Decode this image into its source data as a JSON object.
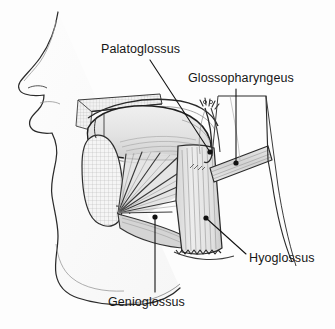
{
  "figure": {
    "background_color": "#fdfdfd",
    "ink_color": "#1a1a1a",
    "label_color": "#161616",
    "width": 335,
    "height": 329
  },
  "labels": [
    {
      "id": "palatoglossus",
      "text": "Palatoglossus",
      "leader": {
        "from_x": 150,
        "from_y": 60,
        "to_x": 210,
        "to_y": 152,
        "dot_x": 210,
        "dot_y": 152
      }
    },
    {
      "id": "glossopharyngeus",
      "text": "Glossopharyngeus",
      "leader": {
        "from_x": 236,
        "from_y": 89,
        "to_x": 236,
        "to_y": 163,
        "dot_x": 236,
        "dot_y": 163
      }
    },
    {
      "id": "hyoglossus",
      "text": "Hyoglossus",
      "leader": {
        "from_x": 246,
        "from_y": 254,
        "to_x": 206,
        "to_y": 218,
        "dot_x": 206,
        "dot_y": 218
      }
    },
    {
      "id": "genioglossus",
      "text": "Genioglossus",
      "leader": {
        "from_x": 155,
        "from_y": 292,
        "to_x": 155,
        "to_y": 217,
        "dot_x": 155,
        "dot_y": 217
      }
    }
  ],
  "anatomy": {
    "structures": [
      "facial profile",
      "nose",
      "upper lip",
      "hard palate",
      "soft palate",
      "tongue dorsum",
      "mandible",
      "styloid process",
      "palatoglossus muscle",
      "glossopharyngeus muscle",
      "hyoglossus muscle",
      "genioglossus muscle",
      "pharyngeal constrictor band",
      "hyoid bone"
    ],
    "shading": {
      "muscle_light": "#ececec",
      "muscle_mid": "#d8d8d8",
      "muscle_dark": "#a8a8a8",
      "bone_fill": "#f4f4f4",
      "hatch": "#9a9a9a"
    }
  }
}
